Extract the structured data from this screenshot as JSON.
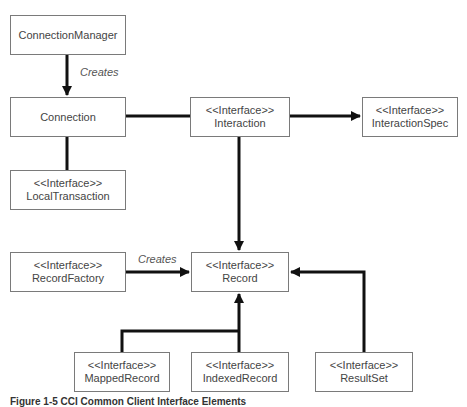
{
  "diagram": {
    "nodes": {
      "connection_manager": {
        "stereotype": "",
        "name": "ConnectionManager"
      },
      "connection": {
        "stereotype": "",
        "name": "Connection"
      },
      "local_transaction": {
        "stereotype": "<<Interface>>",
        "name": "LocalTransaction"
      },
      "interaction": {
        "stereotype": "<<Interface>>",
        "name": "Interaction"
      },
      "interaction_spec": {
        "stereotype": "<<Interface>>",
        "name": "InteractionSpec"
      },
      "record_factory": {
        "stereotype": "<<Interface>>",
        "name": "RecordFactory"
      },
      "record": {
        "stereotype": "<<Interface>>",
        "name": "Record"
      },
      "mapped_record": {
        "stereotype": "<<Interface>>",
        "name": "MappedRecord"
      },
      "indexed_record": {
        "stereotype": "<<Interface>>",
        "name": "IndexedRecord"
      },
      "result_set": {
        "stereotype": "<<Interface>>",
        "name": "ResultSet"
      }
    },
    "edges": [
      {
        "from": "ConnectionManager",
        "to": "Connection",
        "label": "Creates",
        "arrow": true
      },
      {
        "from": "Connection",
        "to": "Interaction",
        "label": "",
        "arrow": false
      },
      {
        "from": "Connection",
        "to": "LocalTransaction",
        "label": "",
        "arrow": false
      },
      {
        "from": "Interaction",
        "to": "InteractionSpec",
        "label": "",
        "arrow": true
      },
      {
        "from": "Interaction",
        "to": "Record",
        "label": "",
        "arrow": true
      },
      {
        "from": "RecordFactory",
        "to": "Record",
        "label": "Creates",
        "arrow": true
      },
      {
        "from": "MappedRecord",
        "to": "Record",
        "label": "",
        "arrow": true
      },
      {
        "from": "IndexedRecord",
        "to": "Record",
        "label": "",
        "arrow": true
      },
      {
        "from": "ResultSet",
        "to": "Record",
        "label": "",
        "arrow": true
      }
    ],
    "edge_labels": {
      "creates_connection": "Creates",
      "creates_record": "Creates"
    },
    "caption": "Figure 1-5   CCI Common Client Interface Elements"
  }
}
